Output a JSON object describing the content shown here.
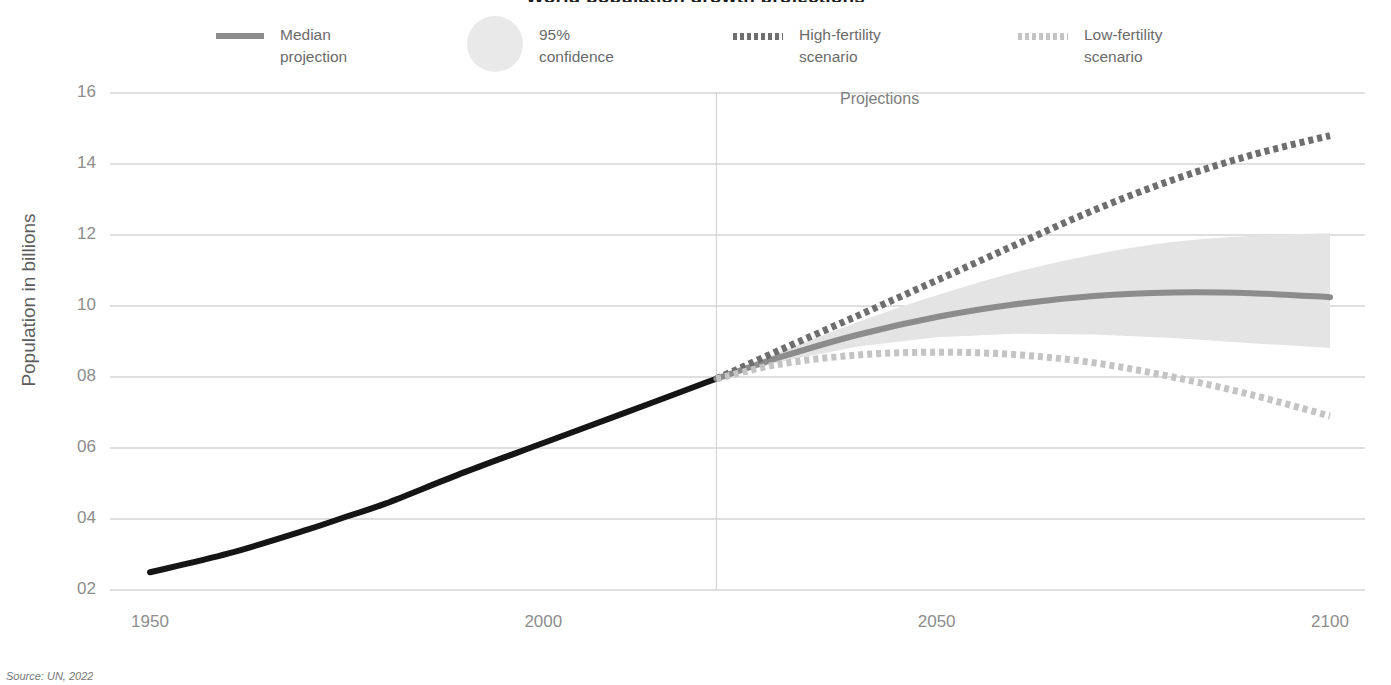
{
  "figure": {
    "title": "World population growth projections",
    "source": "Source: UN, 2022",
    "projections_label": "Projections",
    "background": "#ffffff"
  },
  "legend": {
    "position": "top",
    "items": [
      {
        "key": "median",
        "label": "Median\nprojection",
        "marker": "solid-line",
        "color": "#8c8c8c"
      },
      {
        "key": "confidence",
        "label": "95%\nconfidence",
        "marker": "filled-circle",
        "color": "#e9e9e9"
      },
      {
        "key": "high",
        "label": "High-fertility\nscenario",
        "marker": "dotted-line",
        "color": "#6e6e6e"
      },
      {
        "key": "low",
        "label": "Low-fertility\nscenario",
        "marker": "dotted-line",
        "color": "#c4c4c4"
      }
    ]
  },
  "axes": {
    "ylabel": "Population in billions",
    "yticks": [
      "16",
      "14",
      "12",
      "10",
      "08",
      "06",
      "04",
      "02"
    ],
    "ytick_values": [
      16,
      14,
      12,
      10,
      8,
      6,
      4,
      2
    ],
    "xticks": [
      "1950",
      "2000",
      "2050",
      "2100"
    ],
    "xtick_values": [
      1950,
      2000,
      2050,
      2100
    ],
    "ylim": [
      2,
      16
    ],
    "xlim": [
      1950,
      2100
    ],
    "grid": "horizontal",
    "grid_color": "#bfbfbf",
    "divider_year": 2022,
    "divider_color": "#cfcfcf"
  },
  "chart_data": {
    "type": "line",
    "title": "World population growth projections",
    "xlabel": "",
    "ylabel": "Population in billions",
    "xlim": [
      1950,
      2100
    ],
    "ylim": [
      2,
      16
    ],
    "grid": "horizontal-only",
    "legend_position": "top",
    "annotations": [
      {
        "text": "Projections",
        "x": 2040,
        "y": 15.6
      },
      {
        "text": "Source: UN, 2022",
        "x": 1950,
        "y": 1.2
      }
    ],
    "x": [
      1950,
      1960,
      1970,
      1975,
      1980,
      1990,
      2000,
      2010,
      2020,
      2022,
      2030,
      2040,
      2050,
      2060,
      2070,
      2080,
      2090,
      2100
    ],
    "series": [
      {
        "name": "Historical",
        "style": "solid",
        "color": "#151515",
        "width": 6,
        "x": [
          1950,
          1960,
          1970,
          1975,
          1980,
          1990,
          2000,
          2010,
          2020,
          2022
        ],
        "values": [
          2.5,
          3.03,
          3.7,
          4.07,
          4.44,
          5.32,
          6.14,
          6.96,
          7.79,
          7.95
        ]
      },
      {
        "name": "Median projection",
        "style": "solid",
        "color": "#8c8c8c",
        "width": 6,
        "x": [
          2022,
          2030,
          2040,
          2050,
          2060,
          2070,
          2080,
          2090,
          2100
        ],
        "values": [
          7.95,
          8.55,
          9.19,
          9.69,
          10.05,
          10.28,
          10.38,
          10.36,
          10.25
        ]
      },
      {
        "name": "High-fertility scenario",
        "style": "dotted",
        "color": "#6e6e6e",
        "width": 7,
        "x": [
          2022,
          2030,
          2040,
          2050,
          2060,
          2070,
          2080,
          2090,
          2100
        ],
        "values": [
          7.95,
          8.75,
          9.73,
          10.72,
          11.72,
          12.7,
          13.55,
          14.25,
          14.8
        ]
      },
      {
        "name": "Low-fertility scenario",
        "style": "dotted",
        "color": "#c4c4c4",
        "width": 7,
        "x": [
          2022,
          2030,
          2040,
          2050,
          2060,
          2070,
          2080,
          2090,
          2100
        ],
        "values": [
          7.95,
          8.36,
          8.62,
          8.7,
          8.63,
          8.4,
          8.0,
          7.5,
          6.9
        ]
      }
    ],
    "confidence_band": {
      "name": "95% confidence",
      "color": "#e4e4e4",
      "x": [
        2022,
        2030,
        2040,
        2050,
        2060,
        2070,
        2080,
        2090,
        2100
      ],
      "upper": [
        7.98,
        8.7,
        9.55,
        10.3,
        10.95,
        11.45,
        11.8,
        11.98,
        12.05
      ],
      "lower": [
        7.92,
        8.42,
        8.86,
        9.12,
        9.22,
        9.2,
        9.1,
        8.95,
        8.82
      ]
    }
  }
}
